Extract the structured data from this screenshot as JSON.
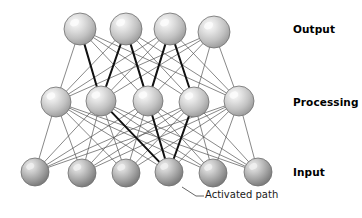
{
  "diagram": {
    "background_color": "#ffffff",
    "labels": {
      "output": "Output",
      "processing": "Processing",
      "input": "Input"
    },
    "annotation": {
      "text": "Activated path",
      "leader_from": [
        182,
        187
      ],
      "leader_bend": [
        196,
        196
      ],
      "leader_to": [
        204,
        196
      ]
    },
    "style": {
      "node_edge_color": "#6e6e6e",
      "node_light_fill": "#c9c9c9",
      "node_light_highlight": "#f2f2f2",
      "node_dark_fill": "#9a9a9a",
      "node_dark_highlight": "#e0e0e0",
      "link_color": "#555555",
      "link_width": 0.7,
      "active_link_color": "#111111",
      "active_link_width": 2.0,
      "label_color": "#000000"
    },
    "layers": [
      {
        "id": "output",
        "name": "Output",
        "node_count": 4,
        "radius": 16,
        "shade": "light",
        "nodes": [
          {
            "id": "o1",
            "cx": 80,
            "cy": 29
          },
          {
            "id": "o2",
            "cx": 126,
            "cy": 29
          },
          {
            "id": "o3",
            "cx": 170,
            "cy": 29
          },
          {
            "id": "o4",
            "cx": 214,
            "cy": 32
          }
        ]
      },
      {
        "id": "processing",
        "name": "Processing",
        "node_count": 5,
        "radius": 15,
        "shade": "light",
        "nodes": [
          {
            "id": "p1",
            "cx": 56,
            "cy": 102
          },
          {
            "id": "p2",
            "cx": 101,
            "cy": 101
          },
          {
            "id": "p3",
            "cx": 148,
            "cy": 101
          },
          {
            "id": "p4",
            "cx": 194,
            "cy": 102
          },
          {
            "id": "p5",
            "cx": 239,
            "cy": 101
          }
        ]
      },
      {
        "id": "input",
        "name": "Input",
        "node_count": 6,
        "radius": 14,
        "shade": "dark",
        "nodes": [
          {
            "id": "i1",
            "cx": 35,
            "cy": 172
          },
          {
            "id": "i2",
            "cx": 82,
            "cy": 173
          },
          {
            "id": "i3",
            "cx": 126,
            "cy": 173
          },
          {
            "id": "i4",
            "cx": 169,
            "cy": 172
          },
          {
            "id": "i5",
            "cx": 213,
            "cy": 173
          },
          {
            "id": "i6",
            "cx": 258,
            "cy": 172
          }
        ]
      }
    ],
    "connections": {
      "input_to_processing": "all-to-all",
      "processing_to_output": "all-to-all",
      "active_paths": [
        {
          "from": "i4",
          "to": "p2"
        },
        {
          "from": "i4",
          "to": "p3"
        },
        {
          "from": "i4",
          "to": "p4"
        },
        {
          "from": "p2",
          "to": "o1"
        },
        {
          "from": "p2",
          "to": "o2"
        },
        {
          "from": "p3",
          "to": "o2"
        },
        {
          "from": "p3",
          "to": "o3"
        },
        {
          "from": "p4",
          "to": "o3"
        }
      ]
    }
  }
}
